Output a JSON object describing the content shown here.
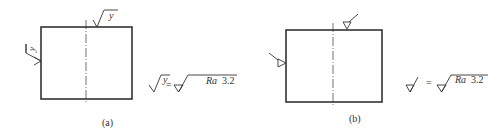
{
  "figure": {
    "panels": [
      {
        "id": "a",
        "caption": "(a)",
        "surface_symbol_letter": "y",
        "equation": {
          "lhs_letter": "y",
          "equals": "=",
          "rhs_param": "Ra",
          "rhs_value": "3.2"
        }
      },
      {
        "id": "b",
        "caption": "(b)",
        "equation": {
          "equals": "=",
          "rhs_param": "Ra",
          "rhs_value": "3.2"
        }
      }
    ],
    "colors": {
      "line": "#333333",
      "background": "#ffffff"
    }
  }
}
